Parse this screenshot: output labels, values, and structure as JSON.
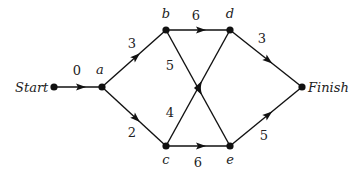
{
  "diagram": {
    "type": "activity-network",
    "nodes": [
      {
        "id": "start",
        "label": "Start",
        "x": 54,
        "y": 87,
        "lx": 15,
        "ly": 92,
        "anchor": "start"
      },
      {
        "id": "a",
        "label": "a",
        "x": 102,
        "y": 87,
        "lx": 100,
        "ly": 74,
        "anchor": "middle"
      },
      {
        "id": "b",
        "label": "b",
        "x": 166,
        "y": 30,
        "lx": 166,
        "ly": 18,
        "anchor": "middle"
      },
      {
        "id": "d",
        "label": "d",
        "x": 230,
        "y": 30,
        "lx": 230,
        "ly": 18,
        "anchor": "middle"
      },
      {
        "id": "c",
        "label": "c",
        "x": 166,
        "y": 146,
        "lx": 166,
        "ly": 164,
        "anchor": "middle"
      },
      {
        "id": "e",
        "label": "e",
        "x": 230,
        "y": 146,
        "lx": 230,
        "ly": 164,
        "anchor": "middle"
      },
      {
        "id": "finish",
        "label": "Finish",
        "x": 302,
        "y": 87,
        "lx": 308,
        "ly": 92,
        "anchor": "start"
      }
    ],
    "edges": [
      {
        "from": "start",
        "to": "a",
        "weight": "0",
        "wx": 77,
        "wy": 75
      },
      {
        "from": "a",
        "to": "b",
        "weight": "3",
        "wx": 132,
        "wy": 48
      },
      {
        "from": "a",
        "to": "c",
        "weight": "2",
        "wx": 132,
        "wy": 137
      },
      {
        "from": "b",
        "to": "d",
        "weight": "6",
        "wx": 196,
        "wy": 20
      },
      {
        "from": "b",
        "to": "e",
        "weight": "5",
        "wx": 170,
        "wy": 70
      },
      {
        "from": "c",
        "to": "d",
        "weight": "4",
        "wx": 170,
        "wy": 117
      },
      {
        "from": "c",
        "to": "e",
        "weight": "6",
        "wx": 198,
        "wy": 167
      },
      {
        "from": "d",
        "to": "finish",
        "weight": "3",
        "wx": 262,
        "wy": 43
      },
      {
        "from": "e",
        "to": "finish",
        "weight": "5",
        "wx": 264,
        "wy": 140
      }
    ]
  }
}
